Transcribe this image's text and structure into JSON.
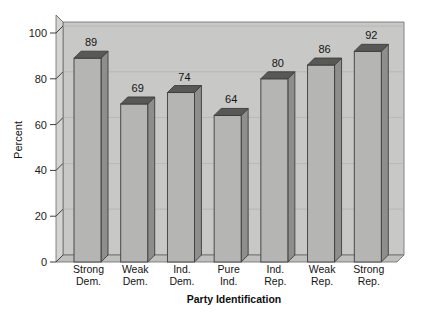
{
  "chart_data": {
    "type": "bar",
    "title": "",
    "xlabel": "Party Identification",
    "ylabel": "Percent",
    "categories": [
      "Strong\nDem.",
      "Weak\nDem.",
      "Ind.\nDem.",
      "Pure\nInd.",
      "Ind.\nRep.",
      "Weak\nRep.",
      "Strong\nRep."
    ],
    "category_lines": [
      [
        "Strong",
        "Dem."
      ],
      [
        "Weak",
        "Dem."
      ],
      [
        "Ind.",
        "Dem."
      ],
      [
        "Pure",
        "Ind."
      ],
      [
        "Ind.",
        "Rep."
      ],
      [
        "Weak",
        "Rep."
      ],
      [
        "Strong",
        "Rep."
      ]
    ],
    "values": [
      89,
      69,
      74,
      64,
      80,
      86,
      92
    ],
    "value_labels": [
      "89",
      "69",
      "74",
      "64",
      "80",
      "86",
      "92"
    ],
    "ylim": [
      0,
      100
    ],
    "yticks": [
      0,
      20,
      40,
      60,
      80,
      100
    ],
    "ytick_labels": [
      "0",
      "20",
      "40",
      "60",
      "80",
      "100"
    ],
    "grid": true,
    "legend": "none",
    "style": "3d-bars",
    "colors": {
      "panel_back": "#c8c8c6",
      "panel_floor": "#bdbdbb",
      "panel_left": "#d2d2d0",
      "bar_front": "#b5b5b3",
      "bar_top": "#585856",
      "bar_side": "#8e8e8c",
      "outline": "#3d3d3d",
      "gridline": "#b0b0ae",
      "background": "#ffffff",
      "text": "#141414"
    }
  }
}
